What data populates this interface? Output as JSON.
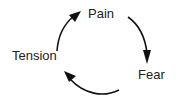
{
  "diagram": {
    "type": "cycle",
    "nodes": [
      {
        "id": "pain",
        "label": "Pain"
      },
      {
        "id": "fear",
        "label": "Fear"
      },
      {
        "id": "tension",
        "label": "Tension"
      }
    ],
    "edges": [
      {
        "from": "pain",
        "to": "fear"
      },
      {
        "from": "fear",
        "to": "tension"
      },
      {
        "from": "tension",
        "to": "pain"
      }
    ],
    "colors": {
      "arrow": "#111111",
      "text": "#222222",
      "background": "#ffffff"
    }
  }
}
